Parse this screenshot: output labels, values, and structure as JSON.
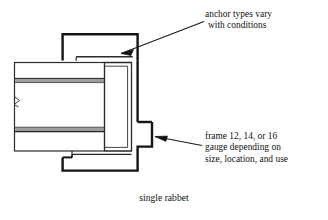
{
  "figure": {
    "caption": "single rabbet"
  },
  "annotations": [
    {
      "id": "anchor-note",
      "line1": "anchor types vary",
      "line2": "with conditions",
      "text": "anchor types vary with conditions",
      "points_to": "frame-head-anchor",
      "leader": {
        "from_x": 205,
        "from_y": 22,
        "to_x": 118,
        "to_y": 55
      }
    },
    {
      "id": "gauge-note",
      "line1": "frame 12, 14, or 16",
      "line2": "gauge depending on",
      "line3": "size, location, and use",
      "text": "frame 12, 14, or 16 gauge depending on size, location, and use",
      "points_to": "frame-profile-jamb",
      "leader": {
        "from_x": 203,
        "from_y": 145,
        "to_x": 153,
        "to_y": 137
      }
    }
  ],
  "drawing": {
    "parts": [
      {
        "name": "frame-profile",
        "description": "hollow metal door frame outline, heavy line weight"
      },
      {
        "name": "wall-section",
        "description": "stud wall with two gypsum board faces shown in gray"
      },
      {
        "name": "gypsum-board-upper",
        "description": "upper wall face layer, gray fill"
      },
      {
        "name": "gypsum-board-lower",
        "description": "lower wall face layer, gray fill"
      },
      {
        "name": "break-line",
        "description": "material break symbol on left edge of wall"
      },
      {
        "name": "rabbet-stop",
        "description": "single rabbet door stop of frame"
      }
    ],
    "colors": {
      "line": "#141414",
      "thin_line": "#2a2a2a",
      "board_fill": "#9a9a9a",
      "board_fill_light": "#b5b5b5",
      "background": "#ffffff"
    },
    "line_weights": {
      "heavy": 2.4,
      "medium": 1.4,
      "thin": 0.9
    }
  }
}
